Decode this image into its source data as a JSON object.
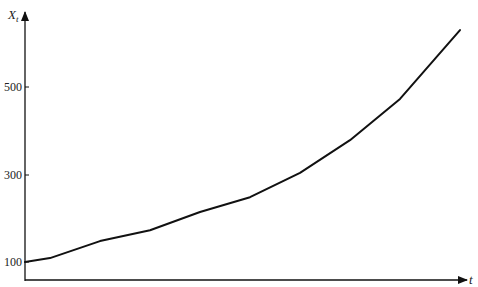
{
  "chart_data": {
    "type": "line",
    "title": "",
    "xlabel": "t",
    "ylabel": "X_t",
    "ylabel_main": "X",
    "ylabel_sub": "t",
    "yticks": [
      100,
      300,
      500
    ],
    "ytick_labels": [
      "100",
      "300",
      "500"
    ],
    "ylim": [
      60,
      680
    ],
    "grid": false,
    "legend": null,
    "series": [
      {
        "name": "X_t",
        "x": [
          0,
          25,
          75,
          125,
          175,
          225,
          275,
          325,
          375,
          435
        ],
        "values": [
          100,
          109,
          148,
          173,
          215,
          249,
          305,
          380,
          475,
          633
        ]
      }
    ]
  }
}
